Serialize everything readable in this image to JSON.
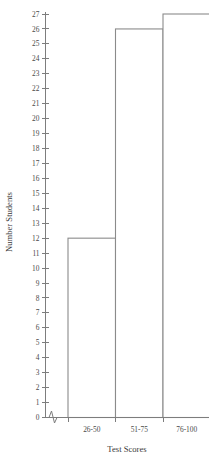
{
  "clipped_header": "­­­ ­­­­­ ­­­­",
  "chart_data": {
    "type": "bar",
    "title": "",
    "xlabel": "Test Scores",
    "ylabel": "Number Students",
    "categories": [
      "26-50",
      "51-75",
      "76-100"
    ],
    "values": [
      12,
      26,
      27
    ],
    "series": [
      {
        "name": "Number Students",
        "values": [
          12,
          26,
          27
        ]
      }
    ],
    "ylim": [
      0,
      27
    ],
    "ytick_labels": [
      "27",
      "26",
      "25",
      "24",
      "23",
      "22",
      "21",
      "20",
      "19",
      "18",
      "17",
      "16",
      "15",
      "14",
      "13",
      "12",
      "11",
      "10",
      "9",
      "8",
      "7",
      "6",
      "5",
      "4",
      "3",
      "2",
      "1",
      "0"
    ],
    "ytick_values": [
      27,
      26,
      25,
      24,
      23,
      22,
      21,
      20,
      19,
      18,
      17,
      16,
      15,
      14,
      13,
      12,
      11,
      10,
      9,
      8,
      7,
      6,
      5,
      4,
      3,
      2,
      1,
      0
    ],
    "grid": false,
    "legend": "none",
    "bar_fill_color": "#ffffff",
    "bar_stroke_color": "#8b8b8b",
    "axis_color": "#7d7d7d",
    "text_color": "#3a3a3a",
    "axis_break": true,
    "axis_break_note": "zigzag break symbol on the horizontal baseline just right of the origin",
    "bars_adjacent": true,
    "last_bar_clipped_right": true
  }
}
